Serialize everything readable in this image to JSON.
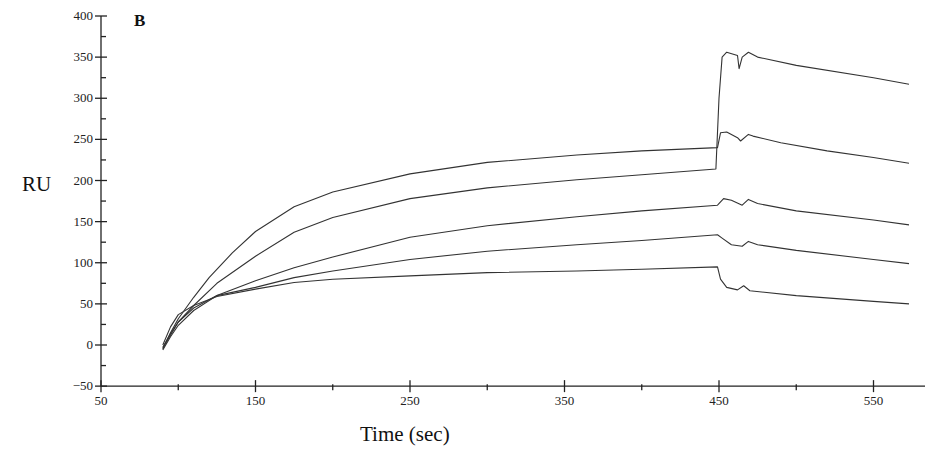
{
  "chart_data": {
    "type": "line",
    "panel_label": "B",
    "title": "",
    "xlabel": "Time (sec)",
    "ylabel": "RU",
    "xlim": [
      50,
      585
    ],
    "ylim": [
      -50,
      400
    ],
    "x_ticks": [
      50,
      150,
      250,
      350,
      450,
      550
    ],
    "y_ticks": [
      -50,
      0,
      50,
      100,
      150,
      200,
      250,
      300,
      350,
      400
    ],
    "grid": false,
    "legend": null,
    "series": [
      {
        "name": "curve-1",
        "points": [
          [
            90,
            -5
          ],
          [
            95,
            15
          ],
          [
            100,
            32
          ],
          [
            110,
            58
          ],
          [
            120,
            82
          ],
          [
            135,
            112
          ],
          [
            150,
            138
          ],
          [
            175,
            168
          ],
          [
            200,
            186
          ],
          [
            250,
            208
          ],
          [
            300,
            222
          ],
          [
            358,
            231
          ],
          [
            400,
            236
          ],
          [
            449,
            240
          ],
          [
            451,
            258
          ],
          [
            455,
            259
          ],
          [
            462,
            252
          ],
          [
            464,
            248
          ],
          [
            469,
            256
          ],
          [
            472,
            254
          ],
          [
            490,
            246
          ],
          [
            520,
            236
          ],
          [
            550,
            228
          ],
          [
            573,
            221
          ]
        ]
      },
      {
        "name": "curve-2",
        "points": [
          [
            90,
            -3
          ],
          [
            95,
            12
          ],
          [
            100,
            28
          ],
          [
            110,
            48
          ],
          [
            125,
            75
          ],
          [
            150,
            108
          ],
          [
            175,
            137
          ],
          [
            200,
            155
          ],
          [
            250,
            178
          ],
          [
            300,
            191
          ],
          [
            358,
            201
          ],
          [
            400,
            207
          ],
          [
            448,
            214
          ],
          [
            450,
            300
          ],
          [
            452,
            350
          ],
          [
            455,
            356
          ],
          [
            462,
            352
          ],
          [
            463,
            336
          ],
          [
            465,
            350
          ],
          [
            469,
            356
          ],
          [
            475,
            350
          ],
          [
            500,
            340
          ],
          [
            550,
            325
          ],
          [
            573,
            317
          ]
        ]
      },
      {
        "name": "curve-3",
        "points": [
          [
            90,
            -6
          ],
          [
            95,
            10
          ],
          [
            100,
            24
          ],
          [
            110,
            42
          ],
          [
            125,
            60
          ],
          [
            150,
            78
          ],
          [
            175,
            94
          ],
          [
            200,
            107
          ],
          [
            250,
            131
          ],
          [
            300,
            145
          ],
          [
            358,
            156
          ],
          [
            400,
            163
          ],
          [
            449,
            170
          ],
          [
            453,
            178
          ],
          [
            458,
            176
          ],
          [
            465,
            170
          ],
          [
            469,
            177
          ],
          [
            475,
            172
          ],
          [
            500,
            163
          ],
          [
            550,
            152
          ],
          [
            573,
            146
          ]
        ]
      },
      {
        "name": "curve-4",
        "points": [
          [
            90,
            -3
          ],
          [
            95,
            14
          ],
          [
            100,
            28
          ],
          [
            110,
            45
          ],
          [
            125,
            60
          ],
          [
            150,
            70
          ],
          [
            175,
            82
          ],
          [
            200,
            90
          ],
          [
            250,
            104
          ],
          [
            300,
            114
          ],
          [
            358,
            122
          ],
          [
            400,
            127
          ],
          [
            449,
            134
          ],
          [
            452,
            130
          ],
          [
            458,
            122
          ],
          [
            465,
            120
          ],
          [
            469,
            126
          ],
          [
            475,
            122
          ],
          [
            500,
            115
          ],
          [
            550,
            104
          ],
          [
            573,
            99
          ]
        ]
      },
      {
        "name": "curve-5",
        "points": [
          [
            90,
            0
          ],
          [
            95,
            22
          ],
          [
            100,
            37
          ],
          [
            110,
            48
          ],
          [
            125,
            59
          ],
          [
            150,
            68
          ],
          [
            175,
            76
          ],
          [
            200,
            80
          ],
          [
            250,
            84
          ],
          [
            300,
            88
          ],
          [
            358,
            90
          ],
          [
            400,
            92
          ],
          [
            449,
            95
          ],
          [
            451,
            80
          ],
          [
            455,
            70
          ],
          [
            462,
            67
          ],
          [
            466,
            72
          ],
          [
            470,
            66
          ],
          [
            500,
            60
          ],
          [
            550,
            53
          ],
          [
            573,
            50
          ]
        ]
      }
    ]
  }
}
